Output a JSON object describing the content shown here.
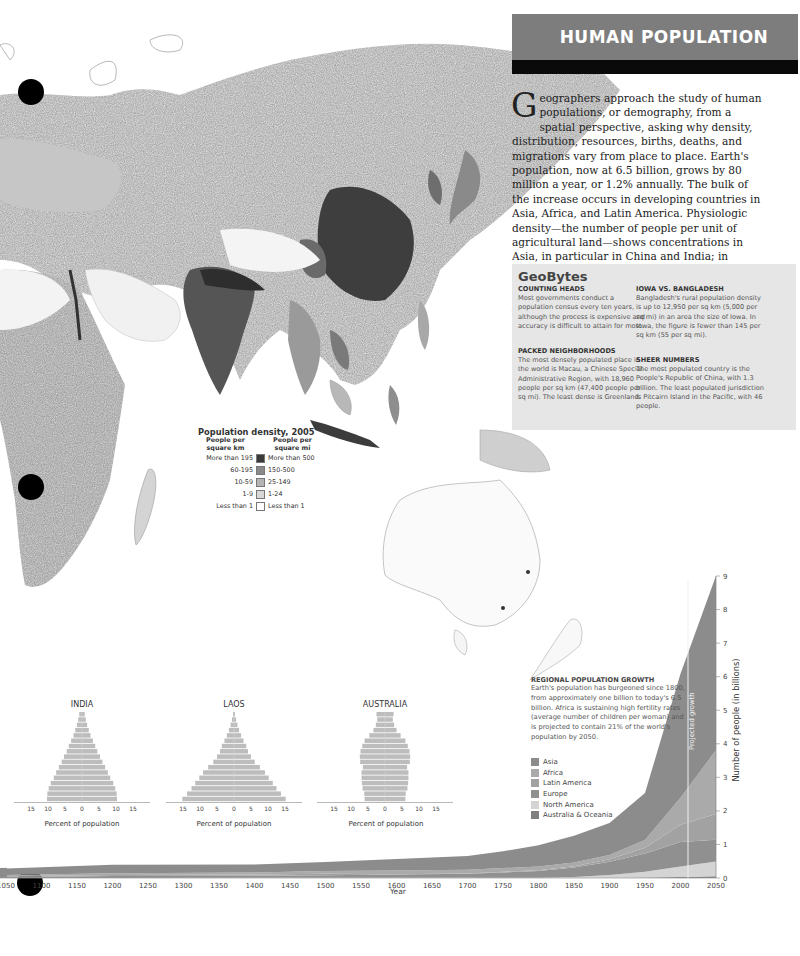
{
  "header": {
    "title": "HUMAN POPULATION"
  },
  "intro": {
    "dropcap": "G",
    "text": "eographers approach the study of human populations, or demography, from a spatial perspective, asking why density, distribution, resources, births, deaths, and migrations vary from place to place. Earth's population, now at 6.5 billion, grows by 80 million a year, or 1.2% annually. The bulk of the increase occurs in developing countries in Asia, Africa, and Latin America. Physiologic density—the number of people per unit of agricultural land—shows concentrations in Asia, in particular in China and India; in Europe, from Britain into Russia; along the eastern seaboard of the United States; and in West Africa in Nigeria and along the Nile Valley."
  },
  "geobytes": {
    "title": "GeoBytes",
    "items": [
      {
        "heading": "COUNTING HEADS",
        "text": "Most governments conduct a population census every ten years, although the process is expensive and accuracy is difficult to attain for most."
      },
      {
        "heading": "PACKED NEIGHBORHOODS",
        "text": "The most densely populated place in the world is Macau, a Chinese Special Administrative Region, with 18,960 people per sq km (47,400 people per sq mi). The least dense is Greenland."
      },
      {
        "heading": "IOWA VS. BANGLADESH",
        "text": "Bangladesh's rural population density is up to 12,950 per sq km (5,000 per sq mi) in an area the size of Iowa. In Iowa, the figure is fewer than 145 per sq km (55 per sq mi)."
      },
      {
        "heading": "SHEER NUMBERS",
        "text": "The most populated country is the People's Republic of China, with 1.3 billion. The least populated jurisdiction is Pitcairn Island in the Pacific, with 46 people."
      }
    ]
  },
  "map_legend": {
    "title": "Population density, 2005",
    "col_km": "People per square km",
    "col_mi": "People per square mi",
    "rows": [
      {
        "km": "More than 195",
        "mi": "More than 500",
        "color": "#3a3a3a"
      },
      {
        "km": "60-195",
        "mi": "150-500",
        "color": "#8a8a8a"
      },
      {
        "km": "10-59",
        "mi": "25-149",
        "color": "#b4b4b4"
      },
      {
        "km": "1-9",
        "mi": "1-24",
        "color": "#d8d8d8"
      },
      {
        "km": "Less than 1",
        "mi": "Less than 1",
        "color": "#ffffff"
      }
    ]
  },
  "growth": {
    "heading": "REGIONAL POPULATION GROWTH",
    "text": "Earth's population has burgeoned since 1800, from approximately one billion to today's 6.5 billion. Africa is sustaining high fertility rates (average number of children per woman) and is projected to contain 21% of the world's population by 2050.",
    "projected_label": "Projected growth",
    "year_label": "Year",
    "y_label": "Number of people (in billions)"
  },
  "chart_data": [
    {
      "type": "area",
      "title": "Regional Population Growth",
      "xlabel": "Year",
      "ylabel": "Number of people (in billions)",
      "x_ticks": [
        "1050",
        "1100",
        "1150",
        "1200",
        "1250",
        "1300",
        "1350",
        "1400",
        "1450",
        "1500",
        "1550",
        "1600",
        "1650",
        "1700",
        "1750",
        "1800",
        "1850",
        "1900",
        "1950",
        "2000",
        "2050"
      ],
      "y_ticks": [
        "0",
        "1",
        "2",
        "3",
        "4",
        "5",
        "6",
        "7",
        "8",
        "9"
      ],
      "ylim": [
        0,
        9
      ],
      "projection_start": 2005,
      "x": [
        1050,
        1200,
        1400,
        1500,
        1600,
        1700,
        1750,
        1800,
        1850,
        1900,
        1950,
        2000,
        2050
      ],
      "series": [
        {
          "name": "Asia",
          "color": "#8c8c8c",
          "values": [
            0.19,
            0.25,
            0.24,
            0.27,
            0.34,
            0.41,
            0.5,
            0.64,
            0.8,
            0.95,
            1.4,
            3.7,
            5.2
          ]
        },
        {
          "name": "Africa",
          "color": "#aaaaaa",
          "values": [
            0.04,
            0.05,
            0.06,
            0.08,
            0.11,
            0.11,
            0.11,
            0.11,
            0.11,
            0.13,
            0.23,
            0.8,
            1.9
          ]
        },
        {
          "name": "Latin America",
          "color": "#a2a2a2",
          "values": [
            0.02,
            0.03,
            0.04,
            0.04,
            0.01,
            0.01,
            0.02,
            0.02,
            0.04,
            0.07,
            0.17,
            0.52,
            0.77
          ]
        },
        {
          "name": "Europe",
          "color": "#909090",
          "values": [
            0.03,
            0.06,
            0.06,
            0.08,
            0.1,
            0.12,
            0.16,
            0.2,
            0.28,
            0.4,
            0.55,
            0.73,
            0.65
          ]
        },
        {
          "name": "North America",
          "color": "#d4d4d4",
          "values": [
            0.002,
            0.002,
            0.002,
            0.003,
            0.003,
            0.003,
            0.003,
            0.007,
            0.03,
            0.08,
            0.17,
            0.31,
            0.44
          ]
        },
        {
          "name": "Australia & Oceania",
          "color": "#7f7f7f",
          "values": [
            0.001,
            0.001,
            0.002,
            0.002,
            0.002,
            0.002,
            0.002,
            0.002,
            0.002,
            0.006,
            0.013,
            0.03,
            0.05
          ]
        }
      ],
      "total_values": [
        0.3,
        0.4,
        0.4,
        0.47,
        0.56,
        0.65,
        0.79,
        0.98,
        1.26,
        1.63,
        2.5,
        6.1,
        9.0
      ]
    },
    {
      "type": "bar",
      "title": "INDIA",
      "xlabel": "Percent of population",
      "x_ticks": [
        "15",
        "10",
        "5",
        "0",
        "5",
        "10",
        "15"
      ],
      "orientation": "horizontal-pyramid",
      "age_groups_count": 17,
      "values_percent_each_side_top_to_bottom": [
        0.8,
        1.1,
        1.5,
        2.0,
        2.5,
        3.2,
        3.9,
        4.5,
        5.3,
        6.0,
        6.8,
        7.6,
        8.3,
        9.2,
        9.8,
        10.2,
        10.3
      ]
    },
    {
      "type": "bar",
      "title": "LAOS",
      "xlabel": "Percent of population",
      "x_ticks": [
        "15",
        "10",
        "5",
        "0",
        "5",
        "10",
        "15"
      ],
      "orientation": "horizontal-pyramid",
      "age_groups_count": 17,
      "values_percent_each_side_top_to_bottom": [
        0.3,
        0.6,
        1.0,
        1.5,
        2.1,
        2.8,
        3.6,
        4.1,
        5.0,
        6.1,
        7.6,
        9.1,
        10.2,
        11.4,
        12.5,
        13.8,
        15.2
      ]
    },
    {
      "type": "bar",
      "title": "AUSTRALIA",
      "xlabel": "Percent of population",
      "x_ticks": [
        "15",
        "10",
        "5",
        "0",
        "5",
        "10",
        "15"
      ],
      "orientation": "horizontal-pyramid",
      "age_groups_count": 17,
      "values_percent_each_side_top_to_bottom": [
        2.5,
        2.3,
        2.7,
        3.4,
        4.6,
        6.0,
        6.7,
        7.2,
        7.4,
        7.3,
        6.5,
        6.9,
        6.9,
        6.8,
        6.6,
        6.1,
        6.0
      ]
    }
  ]
}
